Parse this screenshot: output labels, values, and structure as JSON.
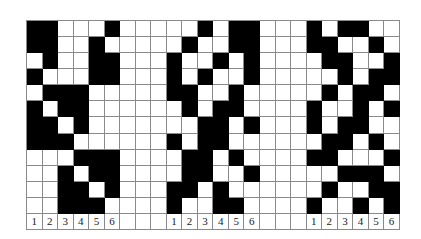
{
  "diagram": {
    "colors": {
      "filled": "#000000",
      "empty": "#ffffff",
      "grid_line": "#8a8a8a"
    },
    "layout": {
      "total_columns": 24,
      "pattern_rows": 12,
      "gap_columns": 3
    },
    "groups": [
      {
        "column_labels": [
          "1",
          "2",
          "3",
          "4",
          "5",
          "6"
        ],
        "rows": [
          [
            1,
            1,
            0,
            0,
            0,
            1
          ],
          [
            1,
            1,
            0,
            0,
            1,
            0
          ],
          [
            0,
            1,
            0,
            0,
            1,
            1
          ],
          [
            1,
            0,
            0,
            0,
            1,
            1
          ],
          [
            0,
            1,
            1,
            1,
            0,
            0
          ],
          [
            1,
            0,
            1,
            1,
            0,
            0
          ],
          [
            1,
            1,
            0,
            1,
            0,
            0
          ],
          [
            1,
            1,
            1,
            0,
            0,
            0
          ],
          [
            0,
            0,
            0,
            1,
            1,
            1
          ],
          [
            0,
            0,
            1,
            0,
            1,
            1
          ],
          [
            0,
            0,
            1,
            1,
            0,
            1
          ],
          [
            0,
            0,
            1,
            1,
            1,
            0
          ]
        ]
      },
      {
        "column_labels": [
          "1",
          "2",
          "3",
          "4",
          "5",
          "6"
        ],
        "rows": [
          [
            0,
            0,
            1,
            0,
            1,
            1
          ],
          [
            0,
            1,
            0,
            0,
            1,
            1
          ],
          [
            1,
            0,
            0,
            1,
            0,
            1
          ],
          [
            1,
            0,
            1,
            0,
            0,
            1
          ],
          [
            1,
            1,
            0,
            0,
            1,
            0
          ],
          [
            0,
            1,
            0,
            1,
            1,
            0
          ],
          [
            0,
            0,
            1,
            1,
            0,
            1
          ],
          [
            1,
            0,
            1,
            1,
            0,
            0
          ],
          [
            0,
            1,
            1,
            0,
            1,
            0
          ],
          [
            0,
            1,
            1,
            0,
            0,
            1
          ],
          [
            1,
            1,
            0,
            1,
            0,
            0
          ],
          [
            1,
            0,
            0,
            1,
            1,
            0
          ]
        ]
      },
      {
        "column_labels": [
          "1",
          "2",
          "3",
          "4",
          "5",
          "6"
        ],
        "rows": [
          [
            1,
            0,
            1,
            1,
            0,
            0
          ],
          [
            1,
            1,
            0,
            0,
            1,
            0
          ],
          [
            0,
            1,
            1,
            0,
            0,
            1
          ],
          [
            0,
            0,
            1,
            0,
            1,
            1
          ],
          [
            0,
            1,
            0,
            1,
            1,
            0
          ],
          [
            1,
            0,
            0,
            1,
            0,
            1
          ],
          [
            1,
            0,
            1,
            1,
            0,
            0
          ],
          [
            0,
            1,
            1,
            0,
            1,
            0
          ],
          [
            1,
            1,
            0,
            0,
            0,
            1
          ],
          [
            0,
            0,
            1,
            1,
            1,
            0
          ],
          [
            0,
            1,
            0,
            0,
            1,
            1
          ],
          [
            1,
            0,
            0,
            1,
            0,
            1
          ]
        ]
      }
    ]
  }
}
